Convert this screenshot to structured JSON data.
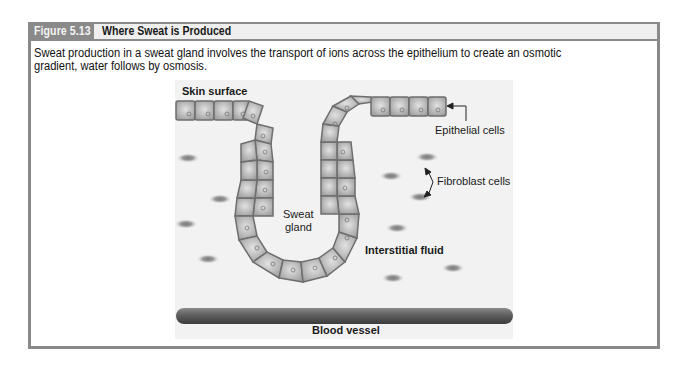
{
  "figure": {
    "number_label": "Figure 5.13",
    "title": "Where Sweat is Produced",
    "caption": "Sweat production in a sweat gland involves the transport of ions across the epithelium to create an osmotic gradient, water follows by osmosis."
  },
  "diagram": {
    "labels": {
      "skin_surface": "Skin surface",
      "epithelial_cells": "Epithelial cells",
      "fibroblast_cells": "Fibroblast cells",
      "sweat_gland_line1": "Sweat",
      "sweat_gland_line2": "gland",
      "interstitial_fluid": "Interstitial fluid",
      "blood_vessel": "Blood vessel"
    },
    "colors": {
      "frame": "#8a8a8a",
      "panel_bg": "#f2f2f2",
      "cell_fill": "#a9a9a9",
      "cell_border": "#6e6e6e",
      "vessel": "#5a5a5a"
    }
  }
}
